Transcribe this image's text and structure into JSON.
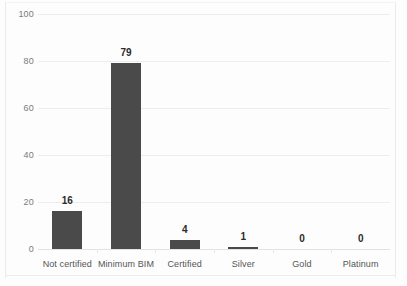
{
  "chart_data": {
    "type": "bar",
    "title": "",
    "subtitle": "",
    "xlabel": "",
    "ylabel": "",
    "categories": [
      "Not certified",
      "Minimum BIM",
      "Certified",
      "Silver",
      "Gold",
      "Platinum"
    ],
    "values": [
      16,
      79,
      4,
      1,
      0,
      0
    ],
    "data_labels": [
      "16",
      "79",
      "4",
      "1",
      "0",
      "0"
    ],
    "ylim": [
      0,
      100
    ],
    "ytick_labels": [
      "0",
      "20",
      "40",
      "60",
      "80",
      "100"
    ],
    "ytick_values": [
      0,
      20,
      40,
      60,
      80,
      100
    ],
    "grid": true,
    "grid_orientation": "horizontal",
    "legend": false,
    "legend_position": "none",
    "series": [
      {
        "name": "Count",
        "values": [
          16,
          79,
          4,
          1,
          0,
          0
        ]
      }
    ],
    "colors": {
      "bar": "#4a4a4a",
      "gridline": "#ededed",
      "baseline": "#e2e2e2",
      "axis_text": "#7b7b7b",
      "category_text": "#555555",
      "data_label_text": "#2b2b2b",
      "background": "#fdfdfd",
      "frame": "#eceaea"
    }
  }
}
